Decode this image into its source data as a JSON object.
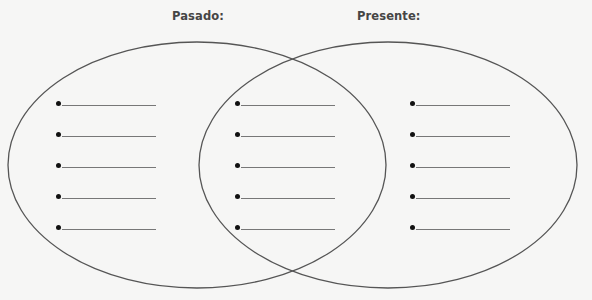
{
  "diagram": {
    "type": "venn",
    "labels": {
      "left": "Pasado:",
      "right": "Presente:"
    },
    "colors": {
      "background": "#f6f6f5",
      "outline": "#555555",
      "label": "#454545",
      "bullet": "#111111",
      "blank_line": "#777777"
    },
    "regions": [
      {
        "name": "pasado-only",
        "bullets": 5
      },
      {
        "name": "overlap",
        "bullets": 5
      },
      {
        "name": "presente-only",
        "bullets": 5
      }
    ]
  }
}
